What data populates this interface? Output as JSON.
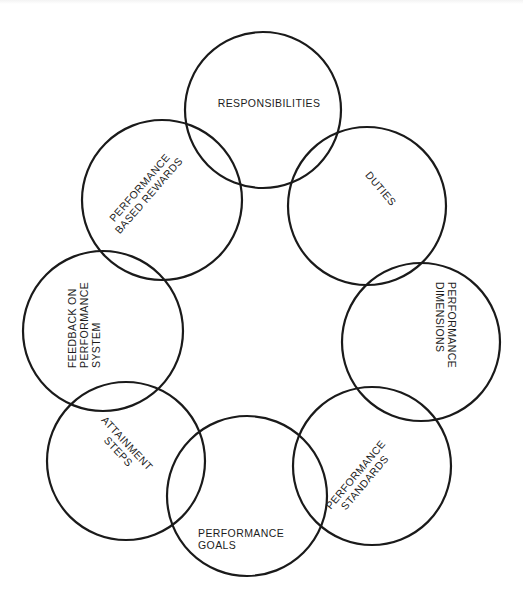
{
  "diagram": {
    "type": "overlapping-circle-cycle",
    "stroke_color": "#1a1a1a",
    "background": "#ffffff",
    "nodes": [
      {
        "id": "responsibilities",
        "lines": [
          "RESPONSIBILITIES"
        ],
        "circle": {
          "cx": 263,
          "cy": 110,
          "r": 78
        },
        "text": {
          "x": 269,
          "y": 107,
          "rotate": 0,
          "anchor": "middle"
        }
      },
      {
        "id": "duties",
        "lines": [
          "DUTIES"
        ],
        "circle": {
          "cx": 367,
          "cy": 206,
          "r": 79
        },
        "text": {
          "x": 378,
          "y": 191,
          "rotate": 50,
          "anchor": "middle"
        }
      },
      {
        "id": "performance-dimensions",
        "lines": [
          "PERFORMANCE",
          "DIMENSIONS"
        ],
        "circle": {
          "cx": 421,
          "cy": 342,
          "r": 79
        },
        "text": {
          "x": 448,
          "y": 282,
          "rotate": 90,
          "anchor": "start"
        }
      },
      {
        "id": "performance-standards",
        "lines": [
          "PERFORMANCE",
          "STANDARDS"
        ],
        "circle": {
          "cx": 372,
          "cy": 466,
          "r": 79
        },
        "text": {
          "x": 363,
          "y": 481,
          "rotate": -50,
          "anchor": "middle"
        }
      },
      {
        "id": "performance-goals",
        "lines": [
          "PERFORMANCE",
          "GOALS"
        ],
        "circle": {
          "cx": 247,
          "cy": 496,
          "r": 80
        },
        "text": {
          "x": 198,
          "y": 537,
          "rotate": 0,
          "anchor": "start"
        }
      },
      {
        "id": "attainment-steps",
        "lines": [
          "ATTAINMENT",
          "STEPS"
        ],
        "circle": {
          "cx": 126,
          "cy": 461,
          "r": 79
        },
        "text": {
          "x": 120,
          "y": 450,
          "rotate": 47,
          "anchor": "middle"
        }
      },
      {
        "id": "feedback-on-performance-system",
        "lines": [
          "FEEDBACK ON",
          "PERFORMANCE",
          "SYSTEM"
        ],
        "circle": {
          "cx": 103,
          "cy": 331,
          "r": 80
        },
        "text": {
          "x": 76,
          "y": 368,
          "rotate": -90,
          "anchor": "start"
        }
      },
      {
        "id": "performance-based-rewards",
        "lines": [
          "PERFORMANCE",
          "BASED REWARDS"
        ],
        "circle": {
          "cx": 162,
          "cy": 200,
          "r": 80
        },
        "text": {
          "x": 147,
          "y": 194,
          "rotate": -49,
          "anchor": "middle"
        }
      }
    ],
    "line_height": 12
  }
}
